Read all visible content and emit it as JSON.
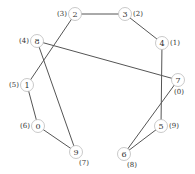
{
  "diagram": {
    "type": "graph",
    "node_radius": 6.5,
    "colors": {
      "edge": "#555555",
      "node_stroke": "#bbbbbb",
      "text": "#333333"
    },
    "nodes": [
      {
        "id": "0",
        "x": 38,
        "y": 126,
        "order": "(6)",
        "label_pos": "left"
      },
      {
        "id": "1",
        "x": 27,
        "y": 85,
        "order": "(5)",
        "label_pos": "left"
      },
      {
        "id": "2",
        "x": 75,
        "y": 14,
        "order": "(3)",
        "label_pos": "left"
      },
      {
        "id": "3",
        "x": 125,
        "y": 14,
        "order": "(2)",
        "label_pos": "right"
      },
      {
        "id": "4",
        "x": 162,
        "y": 43,
        "order": "(1)",
        "label_pos": "right"
      },
      {
        "id": "5",
        "x": 161,
        "y": 126,
        "order": "(9)",
        "label_pos": "right"
      },
      {
        "id": "6",
        "x": 124,
        "y": 154,
        "order": "(8)",
        "label_pos": "below-right"
      },
      {
        "id": "7",
        "x": 178,
        "y": 80,
        "order": "(0)",
        "label_pos": "below"
      },
      {
        "id": "8",
        "x": 37,
        "y": 41,
        "order": "(4)",
        "label_pos": "left"
      },
      {
        "id": "9",
        "x": 76,
        "y": 152,
        "order": "(7)",
        "label_pos": "below-right"
      }
    ],
    "edges": [
      [
        "2",
        "3"
      ],
      [
        "3",
        "4"
      ],
      [
        "4",
        "5"
      ],
      [
        "2",
        "1"
      ],
      [
        "8",
        "7"
      ],
      [
        "8",
        "9"
      ],
      [
        "1",
        "0"
      ],
      [
        "0",
        "9"
      ],
      [
        "7",
        "6"
      ],
      [
        "5",
        "6"
      ]
    ]
  }
}
